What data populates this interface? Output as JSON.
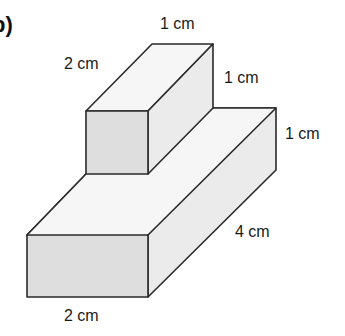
{
  "part_label": "b)",
  "colors": {
    "stroke": "#2a2a2a",
    "top_face": "#f6f6f6",
    "front_face": "#dedede",
    "side_face": "#ebebeb"
  },
  "labels": {
    "top_box_width": "1 cm",
    "top_box_depth": "2 cm",
    "top_box_height": "1 cm",
    "base_height": "1 cm",
    "base_depth": "4 cm",
    "base_width": "2 cm"
  },
  "shape": {
    "description": "Composite solid: a 1 cm × 2 cm × 1 cm cuboid sitting on top of a 2 cm × 4 cm × 1 cm cuboid",
    "top_box": {
      "width_cm": 1,
      "depth_cm": 2,
      "height_cm": 1
    },
    "base_box": {
      "width_cm": 2,
      "depth_cm": 4,
      "height_cm": 1
    }
  }
}
